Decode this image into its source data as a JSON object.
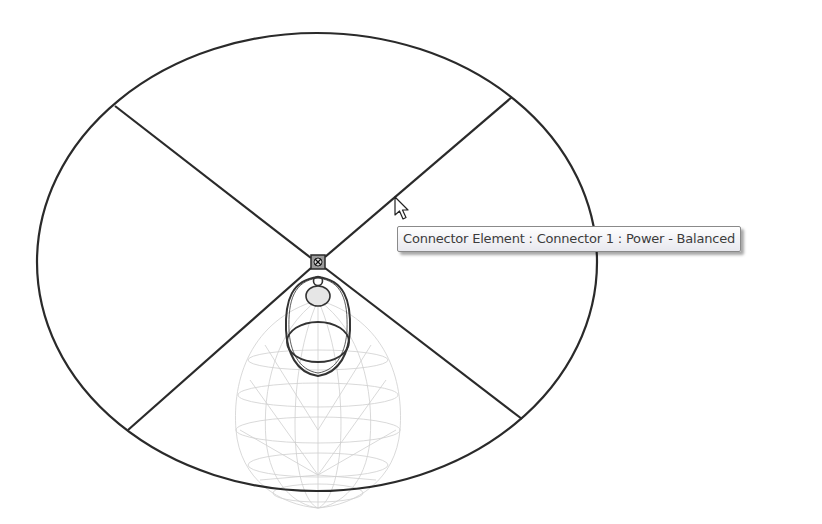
{
  "viewport": {
    "background": "#ffffff",
    "line_color": "#2a2a2a",
    "wireframe_color": "#c8c8c8"
  },
  "drawing": {
    "ellipse": {
      "cx": 317,
      "cy": 262,
      "rx": 280,
      "ry": 229
    },
    "cross_lines": [
      {
        "x1": 115,
        "y1": 106,
        "x2": 317,
        "y2": 262
      },
      {
        "x1": 512,
        "y1": 97,
        "x2": 317,
        "y2": 262
      },
      {
        "x1": 128,
        "y1": 430,
        "x2": 317,
        "y2": 262
      },
      {
        "x1": 522,
        "y1": 419,
        "x2": 317,
        "y2": 262
      }
    ],
    "connector_element": {
      "x": 318,
      "y": 262,
      "size": 14
    }
  },
  "tooltip": {
    "text": "Connector Element : Connector 1 : Power - Balanced"
  },
  "cursor": {
    "type": "arrow-pointer",
    "x": 394,
    "y": 196
  }
}
